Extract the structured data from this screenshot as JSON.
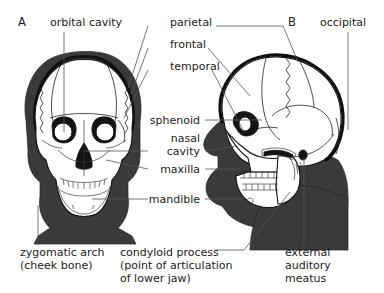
{
  "figure": {
    "background_color": "#ffffff",
    "text_color": "#1b1b1b",
    "bone_fill_color": "#ffffff",
    "soft_tissue_color": "#3a3a3a",
    "outline_color": "#111111",
    "leader_line_color": "#555555"
  },
  "panels": [
    {
      "letter": "A",
      "view": "anterior"
    },
    {
      "letter": "B",
      "view": "lateral"
    }
  ],
  "labels": {
    "orbital_cavity": "orbital cavity",
    "parietal": "parietal",
    "frontal": "frontal",
    "temporal": "temporal",
    "occipital": "occipital",
    "sphenoid": "sphenoid",
    "nasal_line1": "nasal",
    "nasal_line2": "cavity",
    "maxilla": "maxilla",
    "mandible": "mandible",
    "zygomatic_line1": "zygomatic arch",
    "zygomatic_line2": "(cheek bone)",
    "condyloid_line1": "condyloid process",
    "condyloid_line2": "(point of articulation",
    "condyloid_line3": "of lower jaw)",
    "meatus_line1": "external",
    "meatus_line2": "auditory",
    "meatus_line3": "meatus"
  }
}
